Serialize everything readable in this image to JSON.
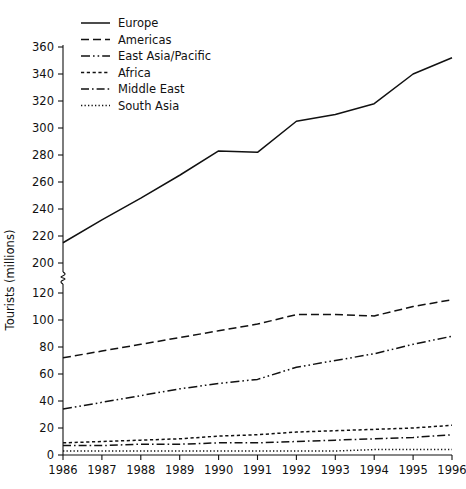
{
  "chart_data": {
    "type": "line",
    "title": "",
    "xlabel": "",
    "ylabel": "Tourists (millions)",
    "grid": false,
    "legend_position": "top-left-inside",
    "axis_break": {
      "present": true,
      "between": [
        200,
        120
      ]
    },
    "categories": [
      "1986",
      "1987",
      "1988",
      "1989",
      "1990",
      "1991",
      "1992",
      "1993",
      "1994",
      "1995",
      "1996"
    ],
    "x_tick_labels": [
      "1986",
      "1987",
      "1988",
      "1989",
      "1990",
      "1991",
      "1992",
      "1993",
      "1994",
      "1995",
      "1996"
    ],
    "y_tick_labels": [
      "0",
      "20",
      "40",
      "60",
      "80",
      "100",
      "120",
      "200",
      "220",
      "240",
      "260",
      "280",
      "300",
      "320",
      "340",
      "360"
    ],
    "y_lower_ticks": [
      0,
      20,
      40,
      60,
      80,
      100,
      120
    ],
    "y_upper_ticks": [
      200,
      220,
      240,
      260,
      280,
      300,
      320,
      340,
      360
    ],
    "series": [
      {
        "name": "Europe",
        "dash": "solid",
        "values": [
          215,
          232,
          248,
          265,
          283,
          282,
          305,
          310,
          318,
          340,
          352
        ]
      },
      {
        "name": "Americas",
        "dash": "dashed",
        "values": [
          72,
          77,
          82,
          87,
          92,
          97,
          104,
          104,
          103,
          110,
          115
        ]
      },
      {
        "name": "East Asia/Pacific",
        "dash": "dash-dot-dot",
        "values": [
          34,
          39,
          44,
          49,
          53,
          56,
          65,
          70,
          75,
          82,
          88
        ]
      },
      {
        "name": "Africa",
        "dash": "fine-dashed",
        "values": [
          9,
          10,
          11,
          12,
          14,
          15,
          17,
          18,
          19,
          20,
          22
        ]
      },
      {
        "name": "Middle East",
        "dash": "dash-dot",
        "values": [
          7,
          7,
          8,
          8,
          9,
          9,
          10,
          11,
          12,
          13,
          15
        ]
      },
      {
        "name": "South Asia",
        "dash": "dotted",
        "values": [
          3,
          3,
          3,
          3,
          3,
          3,
          3,
          3,
          4,
          4,
          4
        ]
      }
    ]
  },
  "legend": {
    "items": [
      {
        "label": "Europe"
      },
      {
        "label": "Americas"
      },
      {
        "label": "East Asia/Pacific"
      },
      {
        "label": "Africa"
      },
      {
        "label": "Middle East"
      },
      {
        "label": "South Asia"
      }
    ]
  },
  "axes": {
    "y_title": "Tourists (millions)"
  }
}
